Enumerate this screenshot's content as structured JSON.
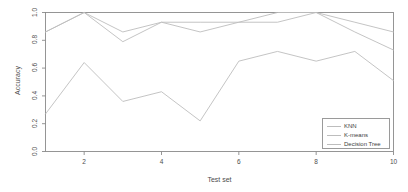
{
  "chart_data": {
    "type": "line",
    "title": "",
    "xlabel": "Test set",
    "ylabel": "Accuracy",
    "x": [
      1,
      2,
      3,
      4,
      5,
      6,
      7,
      8,
      9,
      10
    ],
    "xlim": [
      1,
      10
    ],
    "ylim": [
      0.0,
      1.0
    ],
    "xticks": [
      2,
      4,
      6,
      8,
      10
    ],
    "xtick_labels": [
      "2",
      "4",
      "6",
      "8",
      "10"
    ],
    "yticks": [
      0.0,
      0.2,
      0.4,
      0.6,
      0.8,
      1.0
    ],
    "ytick_labels": [
      "0.0",
      "0.2",
      "0.4",
      "0.6",
      "0.8",
      "1.0"
    ],
    "grid": false,
    "legend_position": "bottom-right",
    "line_color": "#bdbdbd",
    "axis_color": "#8a8a8a",
    "series": [
      {
        "name": "KNN",
        "values": [
          0.86,
          1.0,
          0.86,
          0.93,
          0.93,
          0.93,
          0.93,
          1.0,
          0.93,
          0.86
        ]
      },
      {
        "name": "K-means",
        "values": [
          0.86,
          1.0,
          0.79,
          0.93,
          0.86,
          0.93,
          1.0,
          1.0,
          0.86,
          0.73
        ]
      },
      {
        "name": "Decision Tree",
        "values": [
          0.27,
          0.64,
          0.36,
          0.43,
          0.22,
          0.65,
          0.72,
          0.65,
          0.72,
          0.51
        ]
      }
    ]
  },
  "legend": {
    "entries": [
      "KNN",
      "K-means",
      "Decision Tree"
    ]
  }
}
